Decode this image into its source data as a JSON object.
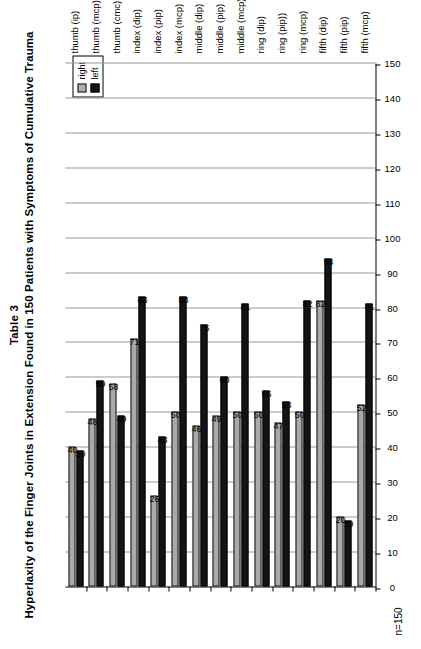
{
  "figure": {
    "table_number": "Table 3",
    "title": "Hyperlaxity of the Finger Joints in Extension Found in 150 Patients with Symptoms of Cumulative Trauma",
    "sample_note": "n=150"
  },
  "legend": {
    "position": "top-left",
    "entries": [
      {
        "label": "right",
        "color": "#d0d0d0",
        "pattern": "hatched"
      },
      {
        "label": "left",
        "color": "#141414",
        "pattern": "solid"
      }
    ]
  },
  "chart_data": {
    "type": "bar",
    "orientation": "horizontal",
    "title": "Hyperlaxity of the Finger Joints in Extension Found in 150 Patients with Symptoms of Cumulative Trauma",
    "subtitle": "Table 3",
    "xlabel": "",
    "ylabel": "",
    "ylim": [
      0,
      150
    ],
    "grid": true,
    "tick_step": 10,
    "tick_labels": [
      "0",
      "10",
      "20",
      "30",
      "40",
      "50",
      "60",
      "70",
      "80",
      "90",
      "100",
      "110",
      "120",
      "130",
      "140",
      "150"
    ],
    "legend_position": "top-left",
    "categories": [
      "thumb (ip)",
      "thumb (mcp)",
      "thumb (cmc)",
      "index (dip)",
      "index (pip)",
      "index (mcp)",
      "middle (dip)",
      "middle (pip)",
      "middle (mcp)",
      "ring (dip)",
      "ring (pip))",
      "ring (mcp)",
      "fifth (dip)",
      "fifth (pip)",
      "fifth (mcp)"
    ],
    "series": [
      {
        "name": "right",
        "color": "#d0d0d0",
        "values": [
          40,
          48,
          58,
          71,
          26,
          50,
          46,
          49,
          50,
          50,
          47,
          50,
          82,
          20,
          52
        ]
      },
      {
        "name": "left",
        "color": "#141414",
        "values": [
          39,
          59,
          49,
          83,
          43,
          83,
          75,
          60,
          81,
          56,
          53,
          82,
          94,
          19,
          81
        ]
      }
    ],
    "data_labels": {
      "thumb (ip)": {
        "right": "40",
        "left": "39"
      },
      "thumb (mcp)": {
        "right": "48",
        "left": "59"
      },
      "thumb (cmc)": {
        "right": "58",
        "left": "49"
      },
      "index (dip)": {
        "right": "71",
        "left": "83"
      },
      "index (pip)": {
        "right": "26",
        "left": "43"
      },
      "index (mcp)": {
        "right": "50",
        "left": "83"
      },
      "middle (dip)": {
        "right": "46",
        "left": "75"
      },
      "middle (pip)": {
        "right": "49",
        "left": "60"
      },
      "middle (mcp)": {
        "right": "50",
        "left": "81"
      },
      "ring (dip)": {
        "right": "50",
        "left": "56"
      },
      "ring (pip))": {
        "right": "47",
        "left": "53"
      },
      "ring (mcp)": {
        "right": "50",
        "left": "82"
      },
      "fifth (dip)": {
        "right": "82",
        "left": "94"
      },
      "fifth (pip)": {
        "right": "20",
        "left": "19"
      },
      "fifth (mcp)": {
        "right": "52",
        "left": "81"
      }
    }
  }
}
